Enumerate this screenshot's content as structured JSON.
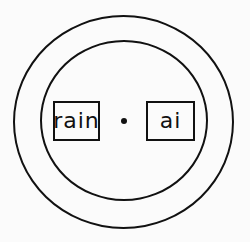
{
  "diagram": {
    "type": "concentric-circles-with-labels",
    "style": "hand-drawn",
    "colors": {
      "stroke": "#111111",
      "background": "#fbfbfb"
    },
    "rings": [
      {
        "name": "outer-ring"
      },
      {
        "name": "inner-ring"
      }
    ],
    "labels": [
      {
        "text": "rain",
        "position": "left"
      },
      {
        "text": "ai",
        "position": "right"
      }
    ],
    "center_marker": "dot"
  }
}
